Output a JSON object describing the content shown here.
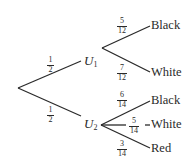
{
  "diagram": {
    "type": "probability-tree",
    "root": {
      "branches": [
        {
          "prob": {
            "num": "1",
            "den": "2"
          },
          "node": {
            "label": "U",
            "sub": "1"
          },
          "children": [
            {
              "prob": {
                "num": "5",
                "den": "12"
              },
              "label": "Black"
            },
            {
              "prob": {
                "num": "7",
                "den": "12"
              },
              "label": "White"
            }
          ]
        },
        {
          "prob": {
            "num": "1",
            "den": "2"
          },
          "node": {
            "label": "U",
            "sub": "2"
          },
          "children": [
            {
              "prob": {
                "num": "6",
                "den": "14"
              },
              "label": "Black"
            },
            {
              "prob": {
                "num": "5",
                "den": "14"
              },
              "label": "White"
            },
            {
              "prob": {
                "num": "3",
                "den": "14"
              },
              "label": "Red"
            }
          ]
        }
      ]
    }
  }
}
